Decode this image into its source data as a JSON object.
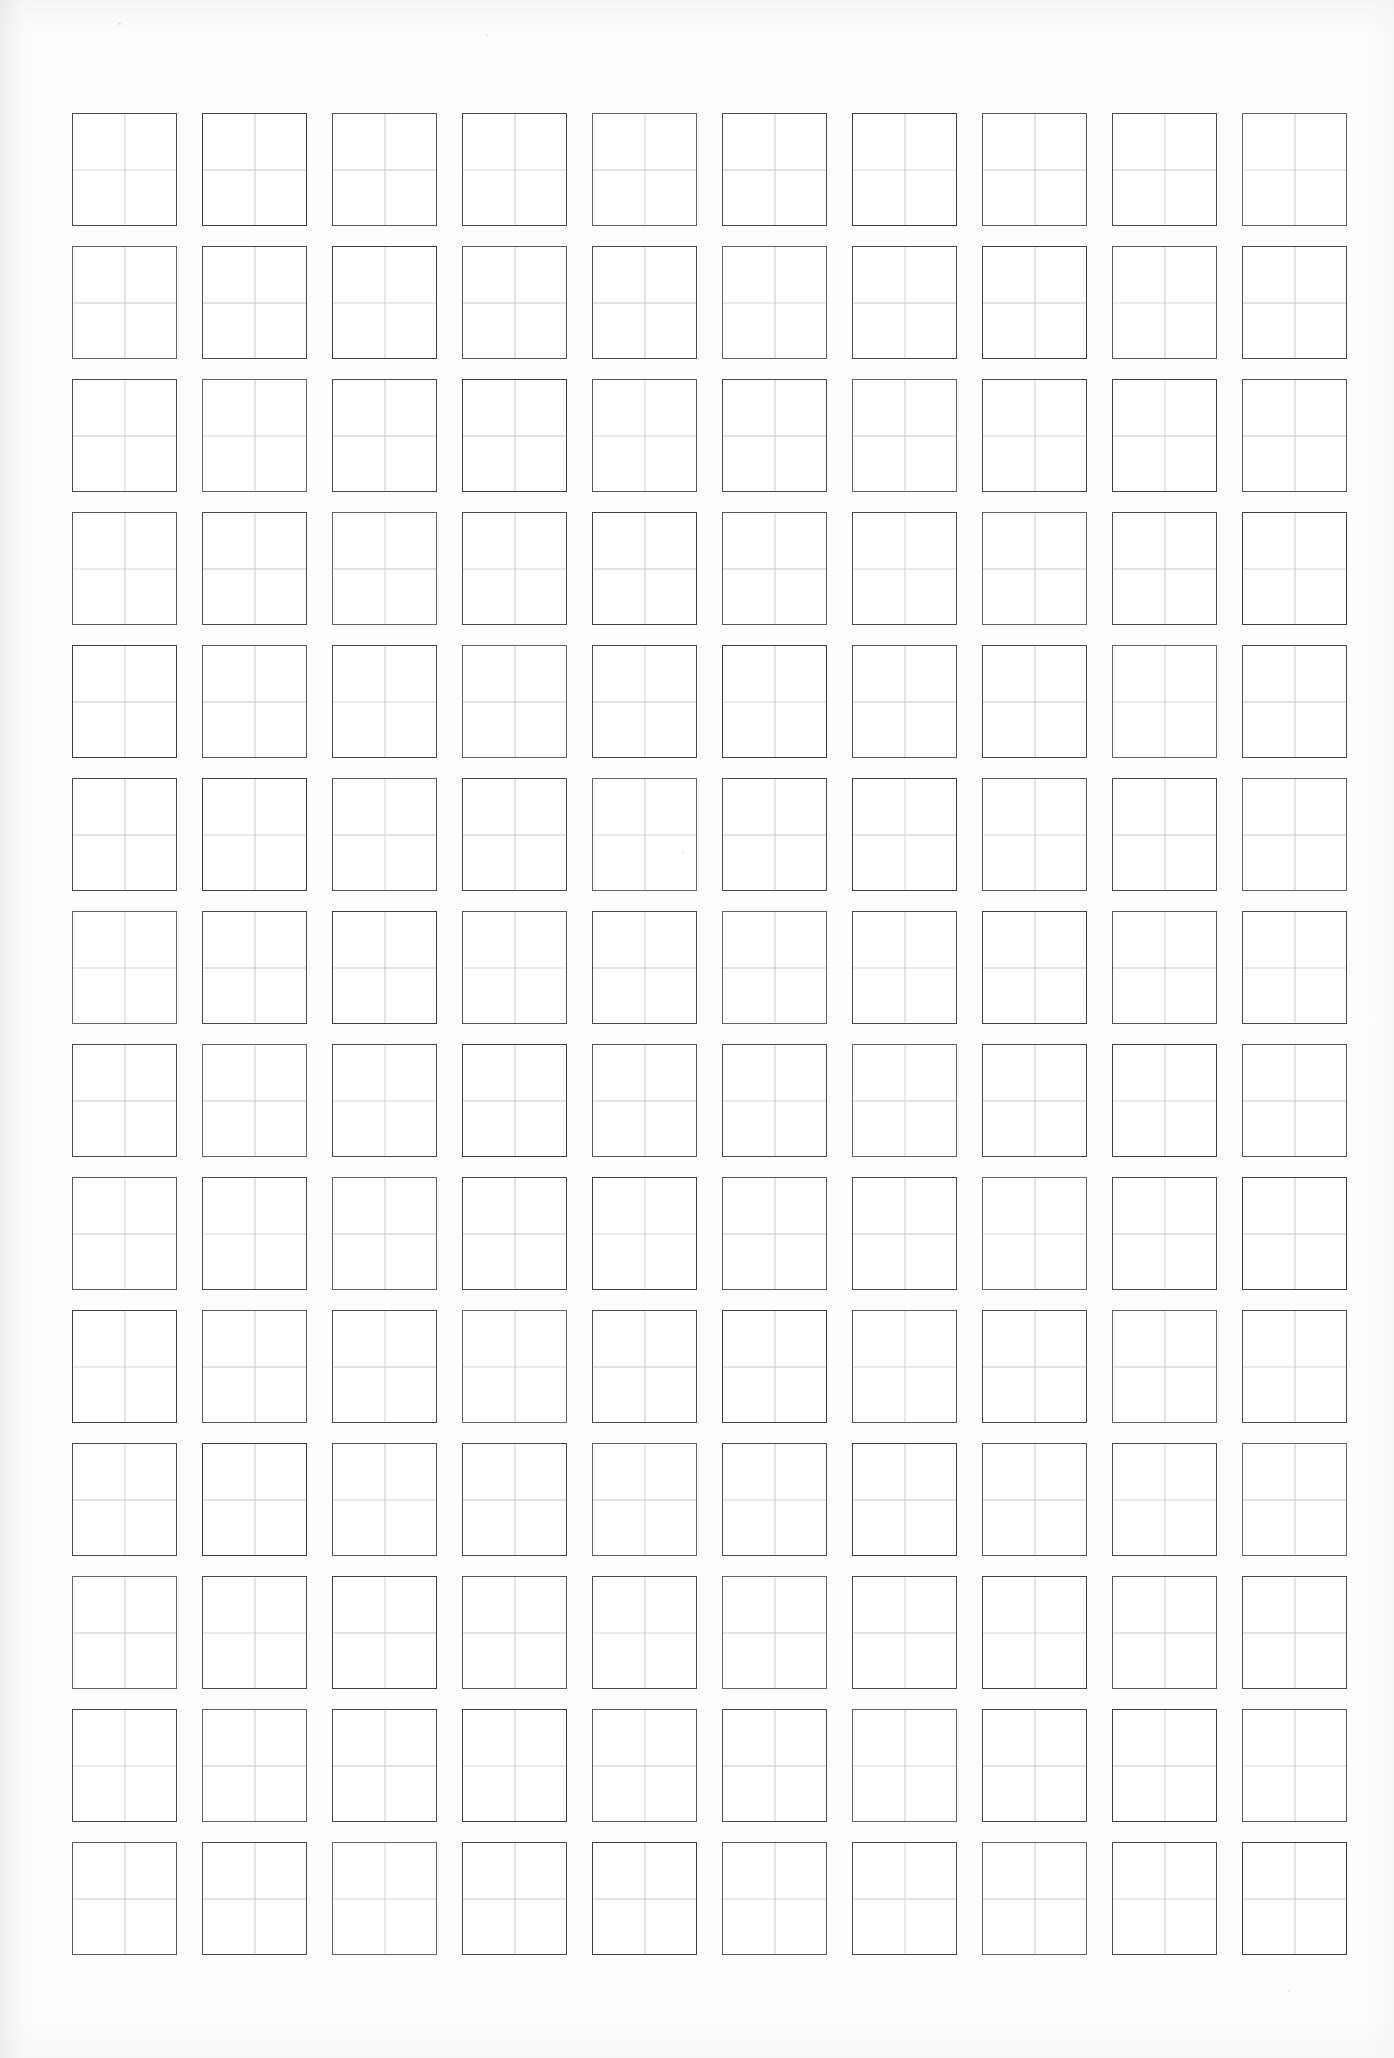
{
  "document": {
    "title": "Character Practice Grid Worksheet",
    "page_background_color": "#fdfdfc",
    "paper_type": "scanned-sheet"
  },
  "grid": {
    "columns": 10,
    "rows": 14,
    "total_cells": 140,
    "cell_type": "four-quadrant-practice-square",
    "cell_label": "",
    "cell_width_px": 105,
    "cell_height_px": 113,
    "column_gap_px": 25,
    "row_gap_px": 20,
    "origin_x_px": 72,
    "origin_y_px": 113,
    "border_color": "#4a4a4c",
    "border_width_px": 1.6,
    "guide_line_color": "#c9c9c9",
    "guide_line_width_px": 1,
    "guides": [
      "horizontal-mid-line",
      "vertical-mid-line"
    ]
  },
  "content": {
    "written_characters": [],
    "header_text": "",
    "footer_text": "",
    "page_number": ""
  },
  "artifacts": {
    "description": "scan-speckle",
    "marks": [
      {
        "x": 118,
        "y": 22,
        "w": 3,
        "h": 3
      },
      {
        "x": 486,
        "y": 34,
        "w": 2,
        "h": 2
      },
      {
        "x": 682,
        "y": 852,
        "w": 2,
        "h": 2
      },
      {
        "x": 1288,
        "y": 1990,
        "w": 2,
        "h": 2
      }
    ]
  }
}
